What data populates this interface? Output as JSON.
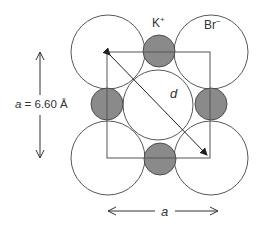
{
  "diagram": {
    "labels": {
      "cation": "K",
      "cation_charge": "+",
      "anion": "Br",
      "anion_charge": "−",
      "diagonal": "d",
      "edge_var": "a",
      "edge_eq": " = 6.60 Å",
      "bottom_edge": "a"
    },
    "colors": {
      "cation_fill": "#8a8a8a",
      "anion_fill": "#ffffff",
      "stroke": "#444444"
    },
    "anions": [
      {
        "cx": 108,
        "cy": 52,
        "r": 37
      },
      {
        "cx": 211,
        "cy": 52,
        "r": 37
      },
      {
        "cx": 108,
        "cy": 158,
        "r": 37
      },
      {
        "cx": 211,
        "cy": 158,
        "r": 37
      },
      {
        "cx": 158,
        "cy": 105,
        "r": 35
      }
    ],
    "cations": [
      {
        "cx": 159,
        "cy": 51,
        "r": 16
      },
      {
        "cx": 107,
        "cy": 104,
        "r": 16
      },
      {
        "cx": 211,
        "cy": 104,
        "r": 16
      },
      {
        "cx": 160,
        "cy": 159,
        "r": 16
      }
    ],
    "square": {
      "x": 107,
      "y": 52,
      "w": 103,
      "h": 106
    }
  }
}
